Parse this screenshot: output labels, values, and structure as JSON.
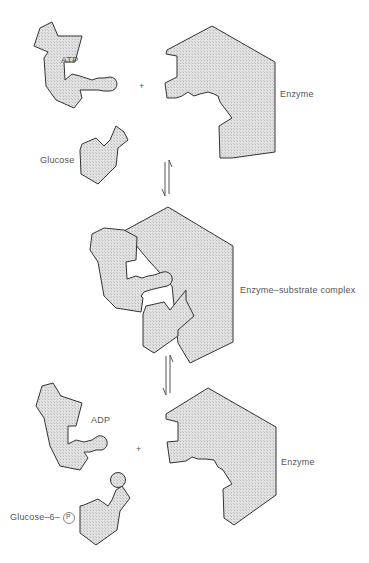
{
  "diagram": {
    "stages": [
      {
        "id": "reactants",
        "labels": {
          "atp": "ATP",
          "plus": "+",
          "enzyme": "Enzyme",
          "glucose": "Glucose"
        }
      },
      {
        "id": "complex",
        "labels": {
          "complex": "Enzyme–substrate complex"
        }
      },
      {
        "id": "products",
        "labels": {
          "adp": "ADP",
          "plus": "+",
          "enzyme": "Enzyme",
          "glucose6p": "Glucose–6–",
          "phosphate": "P"
        }
      }
    ],
    "arrows": [
      {
        "type": "equilibrium",
        "between": [
          "reactants",
          "complex"
        ]
      },
      {
        "type": "equilibrium",
        "between": [
          "complex",
          "products"
        ]
      }
    ],
    "colors": {
      "fill": "#d8d8d8",
      "stroke": "#333333",
      "text": "#555555"
    }
  }
}
